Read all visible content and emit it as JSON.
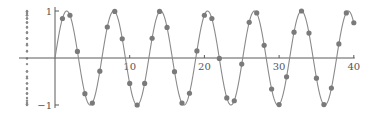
{
  "chart_data": {
    "type": "scatter",
    "title": "",
    "xlabel": "",
    "ylabel": "",
    "function": "y = sin(x)",
    "xlim": [
      0,
      40
    ],
    "ylim": [
      -1,
      1
    ],
    "grid": false,
    "legend": null,
    "x_ticks": [
      10,
      20,
      30,
      40
    ],
    "x_tick_labels": [
      "10",
      "20",
      "30",
      "40"
    ],
    "y_ticks": [
      1,
      -1
    ],
    "y_tick_labels": [
      "1",
      "−1"
    ],
    "overlay": "continuous curve y = sin(x) for x in [0, 40]",
    "projection": "sample y-values also shown as a vertical dot column left of the y-axis",
    "series": [
      {
        "name": "samples",
        "x": [
          1,
          2,
          3,
          4,
          5,
          6,
          7,
          8,
          9,
          10,
          11,
          12,
          13,
          14,
          15,
          16,
          17,
          18,
          19,
          20,
          21,
          22,
          23,
          24,
          25,
          26,
          27,
          28,
          29,
          30,
          31,
          32,
          33,
          34,
          35,
          36,
          37,
          38,
          39,
          40
        ],
        "values": [
          0.84,
          0.91,
          0.14,
          -0.76,
          -0.96,
          -0.28,
          0.66,
          0.99,
          0.41,
          -0.54,
          -1.0,
          -0.54,
          0.42,
          0.99,
          0.65,
          -0.29,
          -0.96,
          -0.75,
          0.15,
          0.91,
          0.84,
          -0.01,
          -0.85,
          -0.91,
          -0.13,
          0.76,
          0.96,
          0.27,
          -0.66,
          -0.99,
          -0.4,
          0.55,
          1.0,
          0.53,
          -0.43,
          -0.99,
          -0.64,
          0.3,
          0.96,
          0.75
        ]
      }
    ]
  },
  "colors": {
    "axis": "#5a5a5a",
    "curve": "#8a8a8a",
    "points": "#7a7a7a",
    "labels": "#555555"
  },
  "layout": {
    "origin_px": [
      55,
      58
    ],
    "x_scale_px_per_unit": 7.47,
    "y_scale_px_per_unit": 47,
    "projection_column_x_px": 27
  }
}
